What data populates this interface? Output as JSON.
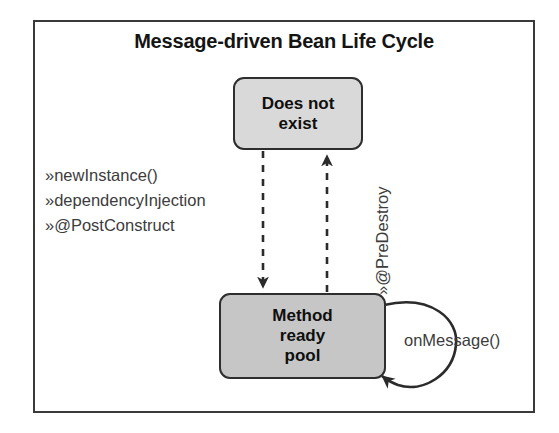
{
  "figure": {
    "title": "Message-driven Bean Life Cycle",
    "frame_color": "#3a3a3a",
    "background": "#ffffff"
  },
  "states": [
    {
      "id": "does-not-exist",
      "line1": "Does not",
      "line2": "exist",
      "line3": "",
      "fill": "#d9d9d9",
      "border": "#2e2e2e"
    },
    {
      "id": "method-ready-pool",
      "line1": "Method",
      "line2": "ready",
      "line3": "pool",
      "fill": "#c6c6c6",
      "border": "#2e2e2e"
    }
  ],
  "callouts": {
    "marker": "»",
    "items": [
      "newInstance()",
      "dependencyInjection",
      "@PostConstruct"
    ]
  },
  "transitions": {
    "predestroy_marker": "»",
    "predestroy_label": "@PreDestroy",
    "loop_label": "onMessage()"
  }
}
